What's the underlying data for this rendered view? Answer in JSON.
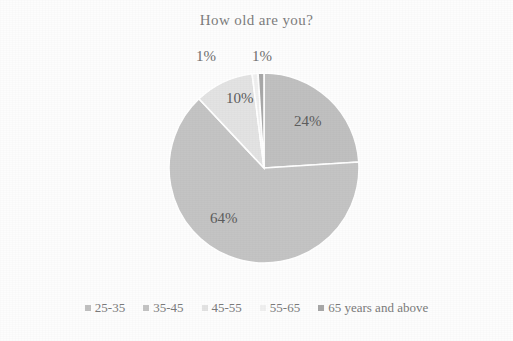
{
  "chart_data": {
    "type": "pie",
    "title": "How old are you?",
    "categories": [
      "25-35",
      "35-45",
      "45-55",
      "55-65",
      "65 years and above"
    ],
    "values": [
      24,
      64,
      10,
      1,
      1
    ],
    "data_labels": [
      "24%",
      "64%",
      "10%",
      "1%",
      "1%"
    ],
    "legend_position": "bottom",
    "grid": false,
    "colors": [
      "#c0c0c0",
      "#c4c4c4",
      "#e3e3e3",
      "#f0f0f0",
      "#a8a8a8"
    ],
    "slice_border_color": "#ffffff",
    "start_angle_deg": 0,
    "direction": "clockwise"
  },
  "legend": {
    "items": [
      {
        "label": "25-35",
        "color": "#c0c0c0"
      },
      {
        "label": "35-45",
        "color": "#c4c4c4"
      },
      {
        "label": "45-55",
        "color": "#e3e3e3"
      },
      {
        "label": "55-65",
        "color": "#f0f0f0"
      },
      {
        "label": "65 years and above",
        "color": "#a8a8a8"
      }
    ]
  },
  "labels": {
    "pct_2535": "24%",
    "pct_3545": "64%",
    "pct_4555": "10%",
    "pct_5565": "1%",
    "pct_65plus": "1%"
  }
}
